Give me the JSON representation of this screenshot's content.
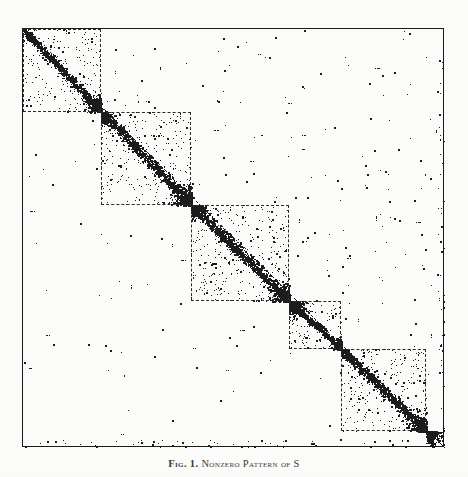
{
  "figure": {
    "caption_label": "Fig. 1.",
    "caption_text": "Nonzero Pattern of S",
    "plot_type": "spy-plot",
    "frame": {
      "x": 22,
      "y": 28,
      "width": 422,
      "height": 419
    },
    "colors": {
      "background": "#fdfdfc",
      "frame": "#1a1a1a",
      "dot": "#1c1c1c",
      "block_border": "#2b2b2b"
    }
  },
  "chart_data": {
    "type": "scatter",
    "title": "Nonzero Pattern of S",
    "xlabel": "",
    "ylabel": "",
    "xlim": [
      0,
      1000
    ],
    "ylim": [
      0,
      1000
    ],
    "grid": false,
    "legend": null,
    "marker": "point",
    "matrix_order": 1000,
    "blocks": [
      {
        "index": 1,
        "x0": 0,
        "x1": 185,
        "y0": 0,
        "y1": 197
      },
      {
        "index": 2,
        "x0": 185,
        "x1": 399,
        "y0": 197,
        "y1": 419
      },
      {
        "index": 3,
        "x0": 399,
        "x1": 630,
        "y0": 419,
        "y1": 649
      },
      {
        "index": 4,
        "x0": 630,
        "x1": 754,
        "y0": 649,
        "y1": 763
      },
      {
        "index": 5,
        "x0": 754,
        "x1": 956,
        "y0": 763,
        "y1": 960
      }
    ],
    "block_boundaries_normalized": [
      0.185,
      0.399,
      0.63,
      0.754,
      0.956
    ],
    "density": {
      "diagonal_band": "dense",
      "within_block": "moderate",
      "off_block": "very sparse"
    },
    "nonzero_count_estimate": 4200
  }
}
